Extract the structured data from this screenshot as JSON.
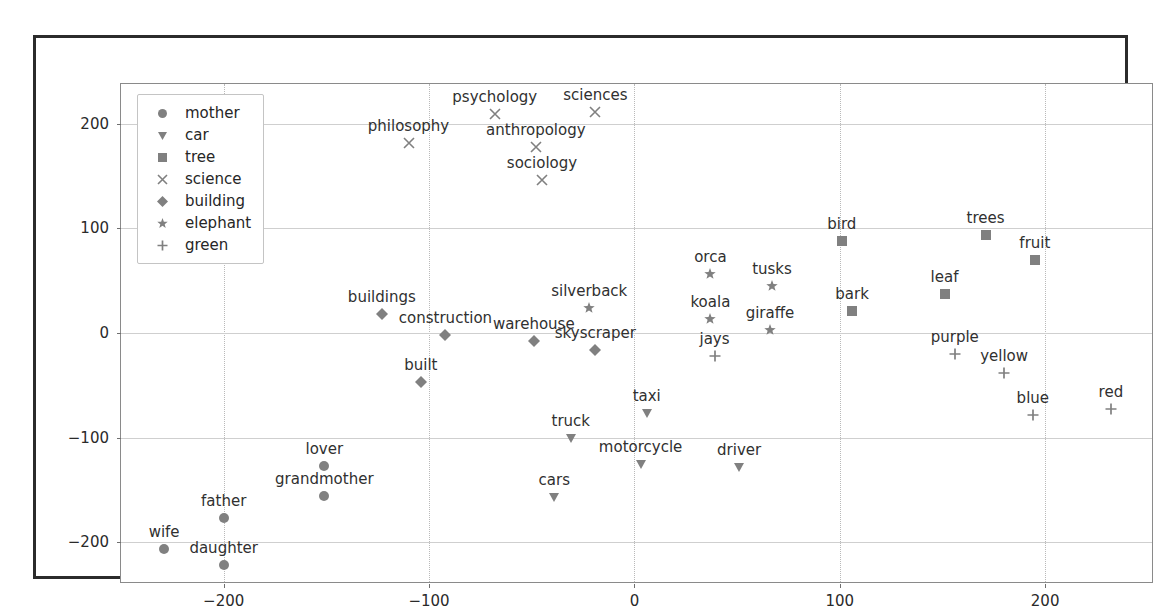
{
  "chart_data": {
    "type": "scatter",
    "title": "",
    "xlabel": "",
    "ylabel": "",
    "xlim": [
      -250,
      253
    ],
    "ylim": [
      -240,
      238
    ],
    "xticks": [
      -200,
      -100,
      0,
      100,
      200
    ],
    "yticks": [
      200,
      100,
      0,
      -100,
      -200
    ],
    "grid": true,
    "legend_position": "upper left",
    "legend": [
      {
        "name": "mother",
        "marker": "circle"
      },
      {
        "name": "car",
        "marker": "triangle-down"
      },
      {
        "name": "tree",
        "marker": "square"
      },
      {
        "name": "science",
        "marker": "x"
      },
      {
        "name": "building",
        "marker": "diamond"
      },
      {
        "name": "elephant",
        "marker": "star"
      },
      {
        "name": "green",
        "marker": "plus"
      }
    ],
    "series": [
      {
        "name": "mother",
        "marker": "circle",
        "points": [
          {
            "label": "wife",
            "x": -229,
            "y": -207
          },
          {
            "label": "daughter",
            "x": -200,
            "y": -222
          },
          {
            "label": "father",
            "x": -200,
            "y": -177
          },
          {
            "label": "grandmother",
            "x": -151,
            "y": -156
          },
          {
            "label": "lover",
            "x": -151,
            "y": -127
          }
        ]
      },
      {
        "name": "car",
        "marker": "triangle-down",
        "points": [
          {
            "label": "cars",
            "x": -39,
            "y": -157
          },
          {
            "label": "truck",
            "x": -31,
            "y": -100
          },
          {
            "label": "taxi",
            "x": 6,
            "y": -77
          },
          {
            "label": "motorcycle",
            "x": 3,
            "y": -125
          },
          {
            "label": "driver",
            "x": 51,
            "y": -128
          }
        ]
      },
      {
        "name": "tree",
        "marker": "square",
        "points": [
          {
            "label": "bird",
            "x": 101,
            "y": 88
          },
          {
            "label": "bark",
            "x": 106,
            "y": 21
          },
          {
            "label": "leaf",
            "x": 151,
            "y": 37
          },
          {
            "label": "trees",
            "x": 171,
            "y": 94
          },
          {
            "label": "fruit",
            "x": 195,
            "y": 70
          }
        ]
      },
      {
        "name": "science",
        "marker": "x",
        "points": [
          {
            "label": "philosophy",
            "x": -110,
            "y": 182
          },
          {
            "label": "psychology",
            "x": -68,
            "y": 209
          },
          {
            "label": "anthropology",
            "x": -48,
            "y": 178
          },
          {
            "label": "sociology",
            "x": -45,
            "y": 146
          },
          {
            "label": "sciences",
            "x": -19,
            "y": 211
          }
        ]
      },
      {
        "name": "building",
        "marker": "diamond",
        "points": [
          {
            "label": "buildings",
            "x": -123,
            "y": 18
          },
          {
            "label": "construction",
            "x": -92,
            "y": -2
          },
          {
            "label": "built",
            "x": -104,
            "y": -47
          },
          {
            "label": "warehouse",
            "x": -49,
            "y": -8
          },
          {
            "label": "skyscraper",
            "x": -19,
            "y": -16
          }
        ]
      },
      {
        "name": "elephant",
        "marker": "star",
        "points": [
          {
            "label": "silverback",
            "x": -22,
            "y": 24
          },
          {
            "label": "orca",
            "x": 37,
            "y": 56
          },
          {
            "label": "koala",
            "x": 37,
            "y": 13
          },
          {
            "label": "tusks",
            "x": 67,
            "y": 45
          },
          {
            "label": "giraffe",
            "x": 66,
            "y": 3
          }
        ]
      },
      {
        "name": "green",
        "marker": "plus",
        "points": [
          {
            "label": "jays",
            "x": 39,
            "y": -22
          },
          {
            "label": "purple",
            "x": 156,
            "y": -20
          },
          {
            "label": "yellow",
            "x": 180,
            "y": -38
          },
          {
            "label": "blue",
            "x": 194,
            "y": -78
          },
          {
            "label": "red",
            "x": 232,
            "y": -73
          }
        ]
      }
    ]
  },
  "colors": {
    "marker": "#808080",
    "text": "#303030",
    "frame": "#2b2b2b",
    "axes_border": "#8a8a8a",
    "grid": "#cfcfcf"
  }
}
